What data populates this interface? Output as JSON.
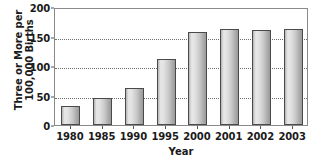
{
  "chart_data": {
    "type": "bar",
    "title": "",
    "categories": [
      "1980",
      "1985",
      "1990",
      "1995",
      "2000",
      "2001",
      "2002",
      "2003"
    ],
    "values": [
      32,
      46,
      63,
      112,
      158,
      163,
      161,
      163
    ],
    "xlabel": "Year",
    "ylabel_lines": [
      "Three or More per",
      "100,000 Births"
    ],
    "ylabel": "Three or More per 100,000 Births",
    "ylim": [
      0,
      200
    ],
    "yticks": [
      0,
      50,
      100,
      150,
      200
    ],
    "ytick_labels": [
      "0",
      "50",
      "100",
      "150",
      "200"
    ],
    "gridlines": [
      50,
      100,
      150
    ],
    "grid": true,
    "legend": null,
    "bar_color": "#d0d0d0",
    "bar_edge_color": "#4a4a4a",
    "axis_color": "#8a8a8a",
    "text_color": "#1a1a1a"
  }
}
